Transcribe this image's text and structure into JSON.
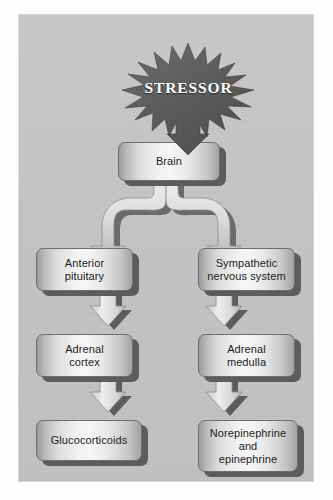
{
  "figure": {
    "type": "flowchart",
    "background_color": "#ffffff",
    "panel_color": "#c3c3c3",
    "box_border_color": "#6e6e6e",
    "shadow_color": "#5c5c5c",
    "burst_color": "#5f5f5f",
    "burst_text_color": "#ffffff",
    "connector_color": "#d9d9d9",
    "label_color": "#1b1b1b"
  },
  "nodes": {
    "stressor": {
      "label": "STRESSOR",
      "shape": "starburst"
    },
    "brain": {
      "label": "Brain",
      "shape": "rounded-box"
    },
    "anterior_pituitary": {
      "label": "Anterior\npituitary",
      "shape": "rounded-box"
    },
    "sympathetic_nervous_system": {
      "label": "Sympathetic\nnervous system",
      "shape": "rounded-box"
    },
    "adrenal_cortex": {
      "label": "Adrenal\ncortex",
      "shape": "rounded-box"
    },
    "adrenal_medulla": {
      "label": "Adrenal\nmedulla",
      "shape": "rounded-box"
    },
    "glucocorticoids": {
      "label": "Glucocorticoids",
      "shape": "rounded-box"
    },
    "norepinephrine_and_epinephrine": {
      "label": "Norepinephrine\nand\nepinephrine",
      "shape": "rounded-box"
    }
  },
  "edges": [
    {
      "from": "stressor",
      "to": "brain",
      "style": "block-arrow-down"
    },
    {
      "from": "brain",
      "to": "anterior_pituitary",
      "style": "curved-ribbon-left"
    },
    {
      "from": "brain",
      "to": "sympathetic_nervous_system",
      "style": "curved-ribbon-right"
    },
    {
      "from": "anterior_pituitary",
      "to": "adrenal_cortex",
      "style": "block-arrow-down"
    },
    {
      "from": "adrenal_cortex",
      "to": "glucocorticoids",
      "style": "block-arrow-down"
    },
    {
      "from": "sympathetic_nervous_system",
      "to": "adrenal_medulla",
      "style": "block-arrow-down"
    },
    {
      "from": "adrenal_medulla",
      "to": "norepinephrine_and_epinephrine",
      "style": "block-arrow-down"
    }
  ],
  "columns": {
    "left_branch": [
      "anterior_pituitary",
      "adrenal_cortex",
      "glucocorticoids"
    ],
    "right_branch": [
      "sympathetic_nervous_system",
      "adrenal_medulla",
      "norepinephrine_and_epinephrine"
    ]
  }
}
